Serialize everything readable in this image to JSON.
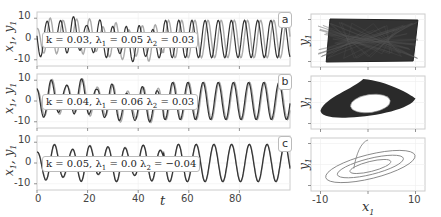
{
  "chart_data": [
    {
      "type": "line",
      "panel": "a",
      "title": "",
      "annotation": "k = 0.03, λ1 = 0.05 λ2 = 0.03",
      "xlabel": "t",
      "ylabel": "x1, y1",
      "xlim": [
        0,
        100
      ],
      "ylim": [
        -13,
        13
      ],
      "yticks": [
        -10,
        0,
        10
      ],
      "series": [
        {
          "name": "x1",
          "color": "#333333",
          "description": "oscillation amplitude ~10, period ~5"
        },
        {
          "name": "y1",
          "color": "#aaaaaa",
          "description": "oscillation, phase-shifted from x1"
        }
      ]
    },
    {
      "type": "line",
      "panel": "b",
      "annotation": "k = 0.04, λ1 = 0.06 λ2 = 0.03",
      "xlabel": "t",
      "ylabel": "x1, y1",
      "xlim": [
        0,
        100
      ],
      "ylim": [
        -13,
        13
      ],
      "yticks": [
        -10,
        0,
        10
      ],
      "series": [
        {
          "name": "x1",
          "color": "#333333"
        },
        {
          "name": "y1",
          "color": "#aaaaaa"
        }
      ]
    },
    {
      "type": "line",
      "panel": "c",
      "annotation": "k = 0.05, λ1 = 0.0 λ2 = −0.04",
      "xlabel": "t",
      "ylabel": "x1, y1",
      "xlim": [
        0,
        100
      ],
      "ylim": [
        -13,
        13
      ],
      "xticks": [
        0,
        20,
        40,
        60,
        80
      ],
      "yticks": [
        -10,
        0,
        10
      ],
      "series": [
        {
          "name": "x1",
          "color": "#333333"
        },
        {
          "name": "y1",
          "color": "#aaaaaa"
        }
      ]
    },
    {
      "type": "line",
      "panel": "a-phase",
      "xlabel": "x1",
      "ylabel": "y1",
      "xlim": [
        -12,
        12
      ],
      "xticks": [
        -10,
        0,
        10
      ],
      "description": "dense filled parallelogram-shaped chaotic attractor"
    },
    {
      "type": "line",
      "panel": "b-phase",
      "xlabel": "x1",
      "ylabel": "y1",
      "xlim": [
        -12,
        12
      ],
      "xticks": [
        -10,
        0,
        10
      ],
      "description": "dense ring-shaped torus attractor"
    },
    {
      "type": "line",
      "panel": "c-phase",
      "xlabel": "x1",
      "ylabel": "y1",
      "xlim": [
        -12,
        12
      ],
      "xticks": [
        -10,
        0,
        10
      ],
      "description": "few nested elliptical closed orbits"
    }
  ],
  "labels": {
    "ylabel": "x1, y1",
    "xlabel_time": "t",
    "ylabel_phase": "y1",
    "xlabel_phase": "x1",
    "panel_a": "a",
    "panel_b": "b",
    "panel_c": "c",
    "ann_a": {
      "k": "k = 0.03, λ",
      "l1": " = 0.05 λ",
      "l2": " = 0.03"
    },
    "ann_b": {
      "k": "k = 0.04, λ",
      "l1": " = 0.06 λ",
      "l2": " = 0.03"
    },
    "ann_c": {
      "k": "k = 0.05, λ",
      "l1": " = 0.0 λ",
      "l2": " = −0.04"
    },
    "yticks": [
      "10",
      "0",
      "-10"
    ],
    "xticks_time": [
      "0",
      "20",
      "40",
      "60",
      "80"
    ],
    "xticks_phase": [
      "-10",
      "10"
    ]
  }
}
